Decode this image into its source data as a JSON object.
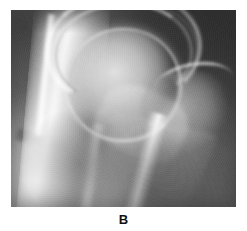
{
  "figure": {
    "panel_label": "B",
    "image_type": "radiograph",
    "modality": "X-ray",
    "body_region": "hip joint (anteroposterior view)",
    "colorspace": "grayscale",
    "frame": {
      "left_px": 11,
      "top_px": 10,
      "width_px": 225,
      "height_px": 197
    },
    "background_color": "#ffffff",
    "film_base_color": "#6e6e6e",
    "bone_highlight_color": "#f4f4f4",
    "soft_tissue_color": "#4a4a4a"
  },
  "anatomy": {
    "structures": [
      {
        "name": "acetabular-roof",
        "label": "Acetabular roof"
      },
      {
        "name": "joint-space",
        "label": "Hip joint space"
      },
      {
        "name": "femoral-head",
        "label": "Femoral head"
      },
      {
        "name": "femoral-neck",
        "label": "Femoral neck"
      },
      {
        "name": "greater-trochanter",
        "label": "Greater trochanter"
      },
      {
        "name": "trochanteric-fossa",
        "label": "Trochanteric fossa"
      },
      {
        "name": "femoral-shaft",
        "label": "Proximal femoral shaft"
      },
      {
        "name": "pelvic-column",
        "label": "Iliac / acetabular column"
      },
      {
        "name": "ischium",
        "label": "Ischium and inferior pubic ramus"
      },
      {
        "name": "soft-tissue",
        "label": "Surrounding soft tissue"
      }
    ]
  },
  "caption": {
    "text": "B"
  }
}
